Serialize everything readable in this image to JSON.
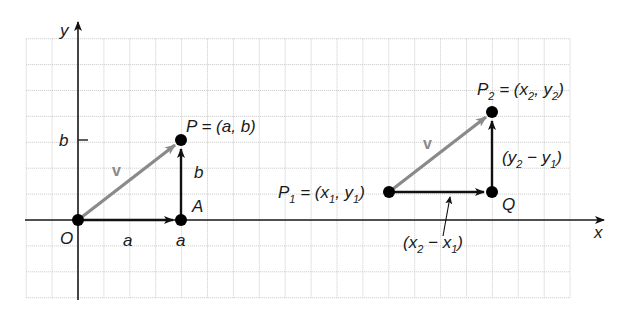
{
  "figure": {
    "colors": {
      "grid": "#c8c8c8",
      "axis": "#1a1a1a",
      "vector_v": "#8a8a8a",
      "component": "#111111",
      "point": "#000000"
    },
    "grid": {
      "left": 25,
      "top": 33,
      "right": 594,
      "bottom": 298,
      "spacing": 25.9
    },
    "axes": {
      "x_label": "x",
      "y_label": "y",
      "origin_px": [
        78,
        220
      ]
    },
    "left_diagram": {
      "origin_label": "O",
      "point_P_label": "P = (a, b)",
      "point_A_label": "A",
      "horizontal_component_label": "a",
      "x_tick_label": "a",
      "vertical_component_label": "b",
      "y_tick_label": "b",
      "vector_label": "v",
      "points_px": {
        "O": [
          78,
          220
        ],
        "A": [
          181,
          220
        ],
        "P": [
          181,
          140
        ]
      }
    },
    "right_diagram": {
      "P1_label": {
        "main": "P",
        "sub": "1",
        "rest": " = (x",
        "sub2": "1",
        "rest2": ", y",
        "sub3": "1",
        "end": ")"
      },
      "P2_label": {
        "main": "P",
        "sub": "2",
        "rest": " = (x",
        "sub2": "2",
        "rest2": ", y",
        "sub3": "2",
        "end": ")"
      },
      "Q_label": "Q",
      "vertical_component_label": {
        "open": "(y",
        "sub": "2",
        "mid": " − y",
        "sub2": "1",
        "close": ")"
      },
      "horizontal_component_label": {
        "open": "(x",
        "sub": "2",
        "mid": " − x",
        "sub2": "1",
        "close": ")"
      },
      "vector_label": "v",
      "points_px": {
        "P1": [
          389,
          192
        ],
        "Q": [
          492,
          192
        ],
        "P2": [
          492,
          112
        ]
      }
    }
  }
}
